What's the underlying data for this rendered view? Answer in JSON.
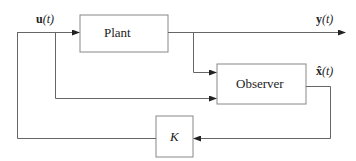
{
  "blocks": {
    "plant": {
      "label": "Plant"
    },
    "observer": {
      "label": "Observer"
    },
    "gain": {
      "label": "K"
    }
  },
  "signals": {
    "input": {
      "symbol": "u",
      "arg": "(t)"
    },
    "output": {
      "symbol": "y",
      "arg": "(t)"
    },
    "estimate": {
      "symbol": "x̂",
      "arg": "(t)"
    }
  },
  "colors": {
    "line": "#666666",
    "box_border": "#888888",
    "text": "#222222"
  }
}
